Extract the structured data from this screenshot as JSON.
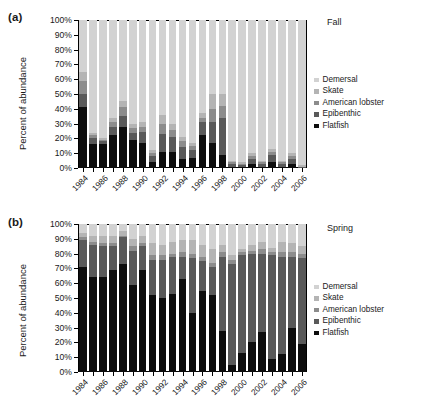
{
  "figure": {
    "ylabel": "Percent of abundance",
    "yticks": [
      "0%",
      "10%",
      "20%",
      "30%",
      "40%",
      "50%",
      "60%",
      "70%",
      "80%",
      "90%",
      "100%"
    ],
    "xticks_all": [
      "1984",
      "1985",
      "1986",
      "1987",
      "1988",
      "1989",
      "1990",
      "1991",
      "1992",
      "1993",
      "1994",
      "1995",
      "1996",
      "1997",
      "1998",
      "1999",
      "2000",
      "2001",
      "2002",
      "2003",
      "2004",
      "2005",
      "2006"
    ],
    "xticks_labeled": [
      "1984",
      "1986",
      "1988",
      "1990",
      "1992",
      "1994",
      "1996",
      "1998",
      "2000",
      "2002",
      "2004",
      "2006"
    ]
  },
  "panels": {
    "a": {
      "tag": "(a)",
      "season": "Spring_unused",
      "season_label": "Fall"
    },
    "b": {
      "tag": "(b)",
      "season_label": "Spring"
    }
  },
  "legend": {
    "items": [
      {
        "label": "Demersal",
        "color": "#d2d2d2"
      },
      {
        "label": "Skate",
        "color": "#b4b4b4"
      },
      {
        "label": "American lobster",
        "color": "#8c8c8c"
      },
      {
        "label": "Epibenthic",
        "color": "#595959"
      },
      {
        "label": "Flatfish",
        "color": "#0d0d0d"
      }
    ]
  },
  "chart_data": [
    {
      "type": "bar",
      "id": "panel-a",
      "title": "(a) Fall",
      "stacked": true,
      "normalized_percent": true,
      "xlabel": "",
      "ylabel": "Percent of abundance",
      "ylim": [
        0,
        100
      ],
      "grid": false,
      "legend_position": "right",
      "categories": [
        "1984",
        "1985",
        "1986",
        "1987",
        "1988",
        "1989",
        "1990",
        "1991",
        "1992",
        "1993",
        "1994",
        "1995",
        "1996",
        "1997",
        "1998",
        "1999",
        "2000",
        "2001",
        "2002",
        "2003",
        "2004",
        "2005",
        "2006"
      ],
      "series": [
        {
          "name": "Flatfish",
          "color": "#0d0d0d",
          "values": [
            41,
            16,
            16,
            22,
            28,
            19,
            17,
            4,
            11,
            11,
            6,
            7,
            22,
            17,
            9,
            1,
            1,
            3,
            1,
            4,
            1,
            3,
            0
          ]
        },
        {
          "name": "Epibenthic",
          "color": "#595959",
          "values": [
            9,
            4,
            2,
            6,
            7,
            5,
            7,
            4,
            12,
            10,
            8,
            5,
            9,
            14,
            25,
            2,
            1,
            3,
            2,
            5,
            2,
            3,
            1
          ]
        },
        {
          "name": "American lobster",
          "color": "#8c8c8c",
          "values": [
            9,
            2,
            1,
            3,
            6,
            3,
            4,
            2,
            7,
            5,
            4,
            3,
            3,
            9,
            8,
            1,
            1,
            2,
            1,
            2,
            1,
            2,
            0
          ]
        },
        {
          "name": "Skate",
          "color": "#b4b4b4",
          "values": [
            6,
            2,
            1,
            3,
            4,
            3,
            3,
            2,
            6,
            4,
            3,
            2,
            3,
            10,
            8,
            1,
            1,
            2,
            1,
            2,
            1,
            2,
            1
          ]
        },
        {
          "name": "Demersal",
          "color": "#d2d2d2",
          "values": [
            35,
            76,
            80,
            66,
            55,
            70,
            69,
            88,
            64,
            70,
            79,
            83,
            63,
            50,
            50,
            95,
            96,
            90,
            95,
            87,
            95,
            90,
            98
          ]
        }
      ]
    },
    {
      "type": "bar",
      "id": "panel-b",
      "title": "(b) Spring",
      "stacked": true,
      "normalized_percent": true,
      "xlabel": "",
      "ylabel": "Percent of abundance",
      "ylim": [
        0,
        100
      ],
      "grid": false,
      "legend_position": "right",
      "categories": [
        "1984",
        "1985",
        "1986",
        "1987",
        "1988",
        "1989",
        "1990",
        "1991",
        "1992",
        "1993",
        "1994",
        "1995",
        "1996",
        "1997",
        "1998",
        "1999",
        "2000",
        "2001",
        "2002",
        "2003",
        "2004",
        "2005",
        "2006"
      ],
      "series": [
        {
          "name": "Flatfish",
          "color": "#0d0d0d",
          "values": [
            71,
            64,
            64,
            69,
            73,
            59,
            69,
            52,
            50,
            53,
            63,
            40,
            55,
            52,
            28,
            5,
            13,
            20,
            27,
            9,
            12,
            30,
            19
          ]
        },
        {
          "name": "Epibenthic",
          "color": "#595959",
          "values": [
            18,
            22,
            21,
            16,
            18,
            23,
            16,
            24,
            26,
            25,
            15,
            37,
            20,
            19,
            50,
            68,
            66,
            60,
            53,
            70,
            66,
            48,
            58
          ]
        },
        {
          "name": "American lobster",
          "color": "#8c8c8c",
          "values": [
            2,
            2,
            2,
            2,
            1,
            3,
            2,
            3,
            3,
            2,
            3,
            3,
            3,
            3,
            3,
            3,
            2,
            2,
            3,
            2,
            3,
            3,
            3
          ]
        },
        {
          "name": "Skate",
          "color": "#b4b4b4",
          "values": [
            3,
            4,
            5,
            5,
            3,
            5,
            5,
            8,
            7,
            8,
            8,
            9,
            8,
            9,
            5,
            3,
            2,
            4,
            5,
            3,
            7,
            6,
            5
          ]
        },
        {
          "name": "Demersal",
          "color": "#d2d2d2",
          "values": [
            6,
            8,
            8,
            8,
            5,
            10,
            8,
            13,
            14,
            12,
            11,
            11,
            14,
            17,
            14,
            21,
            17,
            14,
            12,
            16,
            12,
            13,
            15
          ]
        }
      ]
    }
  ]
}
